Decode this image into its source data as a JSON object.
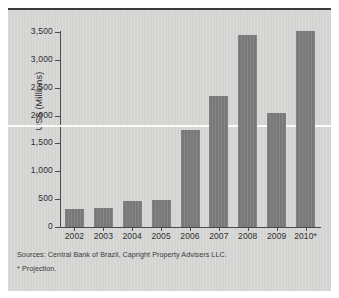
{
  "chart_data": {
    "type": "bar",
    "title": "",
    "xlabel": "",
    "ylabel": "US$ (Millions)",
    "categories": [
      "2002",
      "2003",
      "2004",
      "2005",
      "2006",
      "2007",
      "2008",
      "2009",
      "2010*"
    ],
    "values": [
      330,
      350,
      460,
      490,
      1740,
      2350,
      3450,
      2050,
      3520
    ],
    "ylim": [
      0,
      3500
    ],
    "ytick_values": [
      0,
      500,
      1000,
      1500,
      2000,
      2500,
      3000,
      3500
    ],
    "ytick_labels": [
      "0",
      "500",
      "1,000",
      "1,500",
      "2,000",
      "2,500",
      "3,000",
      "3,500"
    ],
    "grid": false,
    "legend": null,
    "series_color": "#7e7e7e",
    "background_color": "#d6d6d4",
    "reference_line": {
      "value": 1830,
      "color": "#fdfdfb",
      "label": ""
    },
    "annotations": [
      "Sources: Central Bank of Brazil, Capright Property Advisers LLC.",
      "* Projection."
    ]
  },
  "footnotes": {
    "source": "Sources: Central Bank of Brazil, Capright Property Advisers LLC.",
    "projection": "* Projection."
  }
}
